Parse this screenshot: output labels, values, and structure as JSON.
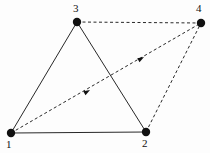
{
  "figure": {
    "type": "graph-diagram",
    "width": 210,
    "height": 153,
    "background_color": "#fdfdfd",
    "ink_color": "#101010"
  },
  "nodes": [
    {
      "id": "1",
      "label": "1",
      "x": 11,
      "y": 133,
      "radius": 4.2,
      "label_x": 8,
      "label_y": 139
    },
    {
      "id": "2",
      "label": "2",
      "x": 146,
      "y": 132,
      "radius": 4.2,
      "label_x": 143,
      "label_y": 138
    },
    {
      "id": "3",
      "label": "3",
      "x": 77,
      "y": 22,
      "radius": 4.2,
      "label_x": 74,
      "label_y": 4
    },
    {
      "id": "4",
      "label": "4",
      "x": 201,
      "y": 23,
      "radius": 4.2,
      "label_x": 197,
      "label_y": 4
    }
  ],
  "edges": [
    {
      "id": "e-1-3",
      "from": "1",
      "to": "3",
      "style": "solid",
      "arrow": false,
      "stroke_width": 0.9
    },
    {
      "id": "e-1-2",
      "from": "1",
      "to": "2",
      "style": "solid",
      "arrow": false,
      "stroke_width": 0.9
    },
    {
      "id": "e-3-2",
      "from": "3",
      "to": "2",
      "style": "solid",
      "arrow": false,
      "stroke_width": 0.9
    },
    {
      "id": "e-3-4",
      "from": "3",
      "to": "4",
      "style": "dashed",
      "arrow": false,
      "stroke_width": 0.9,
      "dash_pattern": "3,2.5"
    },
    {
      "id": "e-2-4",
      "from": "2",
      "to": "4",
      "style": "dashed",
      "arrow": false,
      "stroke_width": 0.9,
      "dash_pattern": "3,2.5"
    },
    {
      "id": "e-1-4",
      "from": "1",
      "to": "4",
      "style": "dashed",
      "arrow": true,
      "stroke_width": 0.9,
      "dash_pattern": "3,2.5"
    }
  ],
  "arrowheads": [
    {
      "id": "arrow-mid-lower",
      "on_edge": "e-1-4",
      "x": 88,
      "y": 91,
      "angle_deg": -29,
      "size": 6
    },
    {
      "id": "arrow-mid-upper",
      "on_edge": "e-1-4",
      "x": 142,
      "y": 58,
      "angle_deg": -29,
      "size": 6
    }
  ]
}
